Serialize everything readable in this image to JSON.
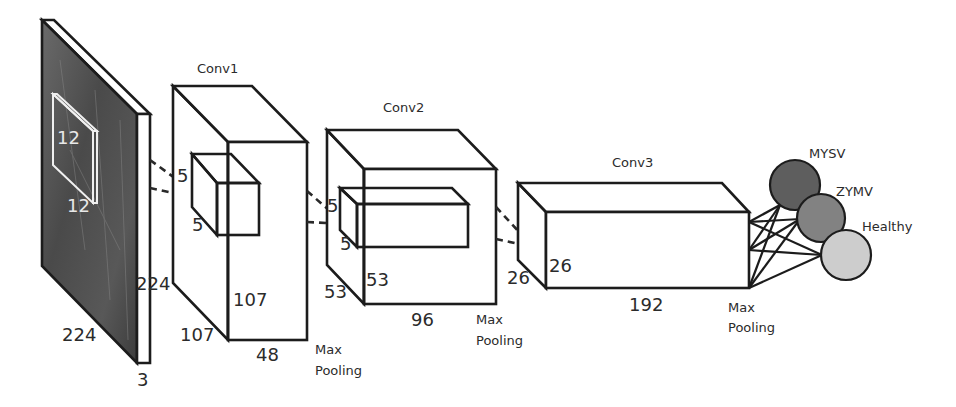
{
  "diagram": {
    "input": {
      "height_label": "224",
      "width_label": "224",
      "depth_label": "3",
      "patch_label_a": "12",
      "patch_label_b": "12",
      "fill_color": "#4a4a4a"
    },
    "conv1": {
      "title": "Conv1",
      "kernel_label_a": "5",
      "kernel_label_b": "5",
      "height_label": "107",
      "depth_label": "107",
      "width_label": "48",
      "pool_label_line1": "Max",
      "pool_label_line2": "Pooling"
    },
    "conv2": {
      "title": "Conv2",
      "kernel_label_a": "5",
      "kernel_label_b": "5",
      "height_label": "53",
      "depth_label": "53",
      "width_label": "96",
      "pool_label_line1": "Max",
      "pool_label_line2": "Pooling"
    },
    "conv3": {
      "title": "Conv3",
      "height_label": "26",
      "depth_label": "26",
      "width_label": "192",
      "pool_label_line1": "Max",
      "pool_label_line2": "Pooling"
    },
    "outputs": [
      {
        "label": "MYSV",
        "color": "#5e5e5e"
      },
      {
        "label": "ZYMV",
        "color": "#828282"
      },
      {
        "label": "Healthy",
        "color": "#cdcdcd"
      }
    ]
  }
}
